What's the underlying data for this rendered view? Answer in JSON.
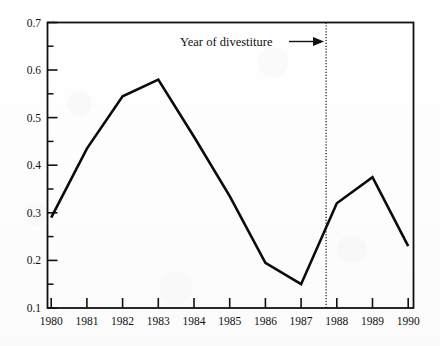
{
  "chart_data": {
    "type": "line",
    "title": "",
    "xlabel": "",
    "ylabel": "",
    "categories": [
      "1980",
      "1981",
      "1982",
      "1983",
      "1984",
      "1985",
      "1986",
      "1987",
      "1988",
      "1989",
      "1990"
    ],
    "x": [
      1980,
      1981,
      1982,
      1983,
      1984,
      1985,
      1986,
      1987,
      1988,
      1989,
      1990
    ],
    "values": [
      0.29,
      0.435,
      0.545,
      0.58,
      0.46,
      0.335,
      0.195,
      0.15,
      0.32,
      0.375,
      0.23
    ],
    "series": [
      {
        "name": "ratio",
        "values": [
          0.29,
          0.435,
          0.545,
          0.58,
          0.46,
          0.335,
          0.195,
          0.15,
          0.32,
          0.375,
          0.23
        ]
      }
    ],
    "ylim": [
      0.1,
      0.7
    ],
    "xlim": [
      1980,
      1990
    ],
    "ytick_labels": [
      "0.1",
      "0.2",
      "0.3",
      "0.4",
      "0.5",
      "0.6",
      "0.7"
    ],
    "ytick_values": [
      0.1,
      0.2,
      0.3,
      0.4,
      0.5,
      0.6,
      0.7
    ],
    "yminor_tick_values": [
      0.15,
      0.25,
      0.35,
      0.45,
      0.55,
      0.65
    ],
    "xtick_labels": [
      "1980",
      "1981",
      "1982",
      "1983",
      "1984",
      "1985",
      "1986",
      "1987",
      "1988",
      "1989",
      "1990"
    ],
    "grid": false,
    "legend": null,
    "legend_position": "none",
    "annotations": [
      {
        "text": "Year of divestiture",
        "marker_type": "vertical-dotted-line",
        "marker_x": 1987.7,
        "arrow": true
      }
    ],
    "line_color": "#0b0b0b",
    "axis_color": "#111111",
    "background_color": "#fefefe"
  }
}
